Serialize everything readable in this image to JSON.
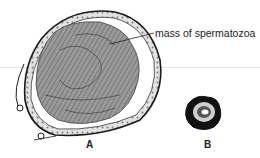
{
  "figure": {
    "callout_label": "mass of spermatozoa",
    "panels": [
      {
        "id": "A",
        "label": "A"
      },
      {
        "id": "B",
        "label": "B"
      }
    ]
  },
  "colors": {
    "ink": "#1a1a1a",
    "mass_fill": "#8a8a8a",
    "wall_fill": "#d8d8d8",
    "background": "#ffffff",
    "faint_line": "#e4e4e4"
  }
}
